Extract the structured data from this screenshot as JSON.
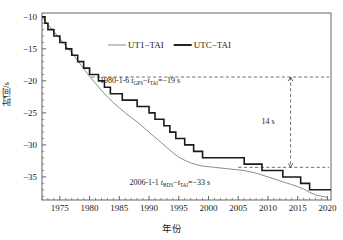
{
  "chart_data": {
    "type": "line",
    "title": "",
    "xlabel": "年份",
    "ylabel": "时间/s",
    "xlim": [
      1972,
      2020.6
    ],
    "ylim": [
      -38.6,
      -9.4
    ],
    "xticks": [
      1975,
      1980,
      1985,
      1990,
      1995,
      2000,
      2005,
      2010,
      2015,
      2020
    ],
    "yticks": [
      -10,
      -15,
      -20,
      -25,
      -30,
      -35
    ],
    "xtick_labels": [
      "1975",
      "1980",
      "1985",
      "1990",
      "1995",
      "2000",
      "2005",
      "2010",
      "2015",
      "2020"
    ],
    "ytick_labels": [
      "−10",
      "−15",
      "−20",
      "−25",
      "−30",
      "−35"
    ],
    "grid": false,
    "minor_ticks_x": 5,
    "minor_ticks_y": 5,
    "legend_position": "top-center",
    "series": [
      {
        "name": "UT1−TAI",
        "style": "thin-gray-smooth",
        "color": "#8c8c8c",
        "width": 1.0,
        "x": [
          1972.0,
          1973.0,
          1974.0,
          1975.0,
          1976.0,
          1977.0,
          1978.0,
          1979.0,
          1980.0,
          1981.0,
          1982.0,
          1983.0,
          1984.0,
          1985.0,
          1986.0,
          1987.0,
          1988.0,
          1989.0,
          1990.0,
          1991.0,
          1992.0,
          1993.0,
          1994.0,
          1995.0,
          1996.0,
          1997.0,
          1998.0,
          1999.0,
          2000.0,
          2001.0,
          2002.0,
          2003.0,
          2004.0,
          2005.0,
          2006.0,
          2007.0,
          2008.0,
          2009.0,
          2010.0,
          2011.0,
          2012.0,
          2013.0,
          2014.0,
          2015.0,
          2016.0,
          2017.0,
          2018.0,
          2019.0,
          2020.0
        ],
        "y": [
          -10.1,
          -11.2,
          -12.3,
          -13.4,
          -14.5,
          -15.6,
          -16.8,
          -18.1,
          -19.3,
          -20.4,
          -21.5,
          -22.5,
          -23.4,
          -24.2,
          -25.0,
          -25.7,
          -26.4,
          -27.2,
          -28.0,
          -28.8,
          -29.6,
          -30.4,
          -31.2,
          -31.9,
          -32.4,
          -32.8,
          -33.1,
          -33.3,
          -33.4,
          -33.5,
          -33.6,
          -33.7,
          -33.8,
          -33.9,
          -34.0,
          -34.2,
          -34.4,
          -34.7,
          -35.0,
          -35.3,
          -35.6,
          -35.9,
          -36.2,
          -36.5,
          -36.9,
          -37.4,
          -37.8,
          -38.0,
          -38.2
        ]
      },
      {
        "name": "UTC−TAI",
        "style": "thick-black-step",
        "color": "#1a1a1a",
        "width": 1.6,
        "steps_x": [
          1972.0,
          1972.5,
          1973.0,
          1974.0,
          1975.0,
          1976.0,
          1977.0,
          1978.0,
          1979.0,
          1980.0,
          1981.5,
          1982.5,
          1983.5,
          1985.5,
          1988.0,
          1990.0,
          1991.0,
          1992.5,
          1993.5,
          1994.5,
          1996.0,
          1997.5,
          1999.0,
          2006.0,
          2009.0,
          2012.5,
          2015.5,
          2017.0,
          2020.6
        ],
        "steps_y": [
          -10.0,
          -11.0,
          -12.0,
          -13.0,
          -14.0,
          -15.0,
          -16.0,
          -17.0,
          -18.0,
          -19.0,
          -20.0,
          -21.0,
          -22.0,
          -23.0,
          -24.0,
          -25.0,
          -26.0,
          -27.0,
          -28.0,
          -29.0,
          -30.0,
          -31.0,
          -32.0,
          -33.0,
          -34.0,
          -35.0,
          -36.0,
          -37.0,
          -37.0
        ]
      }
    ],
    "annotations": [
      {
        "name": "gps-epoch-annotation",
        "text_prefix": "1980-1-6 ",
        "var1": "t",
        "sub1": "GPS",
        "minus": "−",
        "var2": "t",
        "sub2": "TAI",
        "eq": "=−19 s",
        "value": -19,
        "x": 1988.5,
        "y": -20.3
      },
      {
        "name": "bds-epoch-annotation",
        "text_prefix": "2006-1-1 ",
        "var1": "t",
        "sub1": "BDS",
        "minus": "−",
        "var2": "t",
        "sub2": "TAI",
        "eq": "=−33 s",
        "value": -33,
        "x": 1993.5,
        "y": -36.3
      },
      {
        "name": "offset-gap-annotation",
        "text": "14 s",
        "value": 14,
        "x": 2010.0,
        "y": -26.8
      }
    ],
    "reference_lines": [
      {
        "name": "gps-offset-line",
        "orientation": "horizontal",
        "y": -19.4,
        "x_from": 1980.3,
        "x_to": 2020.3,
        "dash": true
      },
      {
        "name": "bds-offset-line",
        "orientation": "horizontal",
        "y": -33.5,
        "x_from": 2005.0,
        "x_to": 2020.3,
        "dash": true
      },
      {
        "name": "gap-arrow-line",
        "orientation": "vertical",
        "x": 2013.8,
        "y_from": -19.4,
        "y_to": -33.5,
        "dash": true,
        "arrows": "both"
      }
    ]
  },
  "legend": {
    "items": [
      {
        "label": "UT1−TAI",
        "color": "#8c8c8c",
        "thickness": "thin"
      },
      {
        "label": "UTC−TAI",
        "color": "#1a1a1a",
        "thickness": "thick"
      }
    ]
  },
  "axes": {
    "y_title": "时间/s",
    "x_title": "年份"
  }
}
